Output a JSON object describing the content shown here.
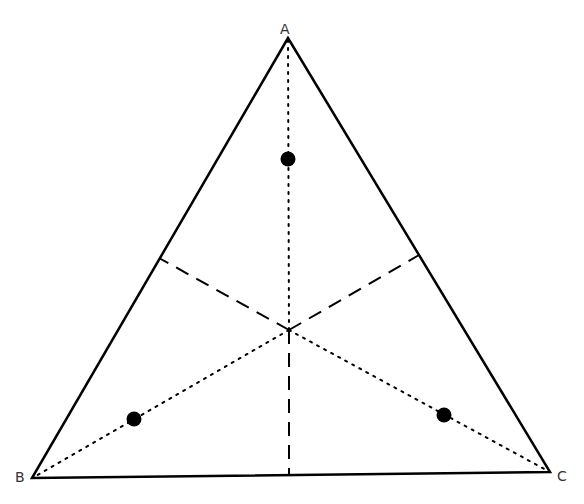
{
  "diagram": {
    "type": "equilateral-triangle-with-centroid",
    "colors": {
      "stroke": "#000000",
      "label": "#333333",
      "background": "#ffffff"
    },
    "vertices": [
      {
        "id": "A",
        "label": "A",
        "x": 288,
        "y": 38
      },
      {
        "id": "B",
        "label": "B",
        "x": 32,
        "y": 478
      },
      {
        "id": "C",
        "label": "C",
        "x": 550,
        "y": 472
      }
    ],
    "centroid": {
      "x": 289,
      "y": 330
    },
    "points": [
      {
        "near": "A",
        "x": 288,
        "y": 159
      },
      {
        "near": "B",
        "x": 134,
        "y": 419
      },
      {
        "near": "C",
        "x": 444,
        "y": 415
      }
    ],
    "dotted_lines": [
      "centroid-to-A",
      "centroid-to-B",
      "centroid-to-C"
    ],
    "dashed_lines": [
      "centroid-to-AB-midpoint",
      "centroid-to-AC-midpoint",
      "centroid-to-BC-midpoint"
    ],
    "labels": {
      "A": "A",
      "B": "B",
      "C": "C"
    }
  }
}
